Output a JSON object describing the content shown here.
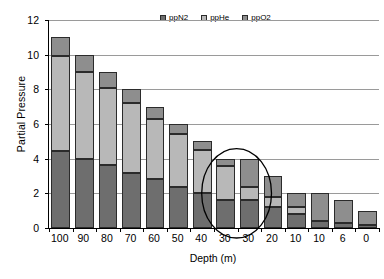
{
  "chart_data": {
    "type": "bar",
    "stacked": true,
    "title": "",
    "xlabel": "Depth (m)",
    "ylabel": "Partial Pressure",
    "ylim": [
      0,
      12
    ],
    "ytick_step": 2,
    "yticks": [
      "0",
      "2",
      "4",
      "6",
      "8",
      "10",
      "12"
    ],
    "grid": true,
    "legend_position": "top-center",
    "categories": [
      "100",
      "90",
      "80",
      "70",
      "60",
      "50",
      "40",
      "30",
      "30",
      "20",
      "10",
      "10",
      "6",
      "0"
    ],
    "series": [
      {
        "name": "ppN2",
        "color": "#6e6e6e",
        "values": [
          4.45,
          4.0,
          3.65,
          3.2,
          2.8,
          2.35,
          2.0,
          1.6,
          1.6,
          1.2,
          0.8,
          0.4,
          0.3,
          0.2
        ]
      },
      {
        "name": "ppHe",
        "color": "#b8b8b8",
        "values": [
          5.45,
          5.0,
          4.45,
          4.0,
          3.5,
          3.05,
          2.5,
          2.0,
          0.75,
          0.6,
          0.4,
          0.0,
          0.0,
          0.0
        ]
      },
      {
        "name": "ppO2",
        "color": "#8e8e8e",
        "values": [
          1.1,
          1.0,
          0.9,
          0.8,
          0.7,
          0.6,
          0.5,
          0.4,
          1.65,
          1.2,
          0.8,
          1.6,
          1.3,
          0.8
        ]
      }
    ],
    "totals": [
      11.0,
      10.0,
      9.0,
      8.0,
      7.0,
      6.0,
      5.0,
      4.0,
      4.0,
      3.0,
      2.0,
      2.0,
      1.6,
      1.0
    ],
    "annotations": [
      {
        "name": "highlight-ellipse",
        "shape": "ellipse",
        "covers_categories": [
          "30",
          "30"
        ],
        "color": "#000000"
      }
    ]
  },
  "legend": {
    "entries": [
      {
        "label": "ppN2",
        "icon": "legend-swatch-icon"
      },
      {
        "label": "ppHe",
        "icon": "legend-swatch-icon"
      },
      {
        "label": "ppO2",
        "icon": "legend-swatch-icon"
      }
    ]
  }
}
